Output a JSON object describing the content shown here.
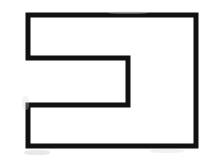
{
  "canvas": {
    "width": 216,
    "height": 161,
    "background_color": "#ffffff",
    "description": "Hand-drawn black outline of a rectangular block with a rectangular notch cut into its left side, forming a reversed C / bracket shape"
  },
  "shape": {
    "name": "notched-rectangle-outline",
    "stroke_color": "#111111",
    "stroke_width": 5,
    "fill": "none",
    "vertex_count": 8,
    "points": [
      {
        "x": 28,
        "y": 15
      },
      {
        "x": 196,
        "y": 15
      },
      {
        "x": 196,
        "y": 146
      },
      {
        "x": 28,
        "y": 146
      },
      {
        "x": 28,
        "y": 105
      },
      {
        "x": 128,
        "y": 105
      },
      {
        "x": 128,
        "y": 58
      },
      {
        "x": 28,
        "y": 58
      }
    ],
    "points_attr": "28,15 196,15 196,146 28,146 28,105 128,105 128,58 28,58",
    "edges": [
      {
        "name": "top-edge",
        "from": 0,
        "to": 1,
        "orientation": "horizontal"
      },
      {
        "name": "right-edge",
        "from": 1,
        "to": 2,
        "orientation": "vertical"
      },
      {
        "name": "bottom-edge",
        "from": 2,
        "to": 3,
        "orientation": "horizontal"
      },
      {
        "name": "lower-left-edge",
        "from": 3,
        "to": 4,
        "orientation": "vertical"
      },
      {
        "name": "notch-bottom-edge",
        "from": 4,
        "to": 5,
        "orientation": "horizontal"
      },
      {
        "name": "notch-right-edge",
        "from": 5,
        "to": 6,
        "orientation": "vertical"
      },
      {
        "name": "notch-top-edge",
        "from": 6,
        "to": 7,
        "orientation": "horizontal"
      },
      {
        "name": "upper-left-edge",
        "from": 7,
        "to": 0,
        "orientation": "vertical"
      }
    ]
  },
  "artifacts": {
    "smudges": [
      {
        "name": "smudge-bottom-left",
        "note": "faint gray scan smudge below lower-left corner"
      },
      {
        "name": "smudge-bottom-right",
        "note": "faint gray scan smudge below bottom edge right of center"
      },
      {
        "name": "smudge-top-right",
        "note": "faint gray scan smudge above top edge"
      },
      {
        "name": "smudge-left-mid",
        "note": "faint gray scan smudge left of notch bottom corner"
      }
    ]
  }
}
